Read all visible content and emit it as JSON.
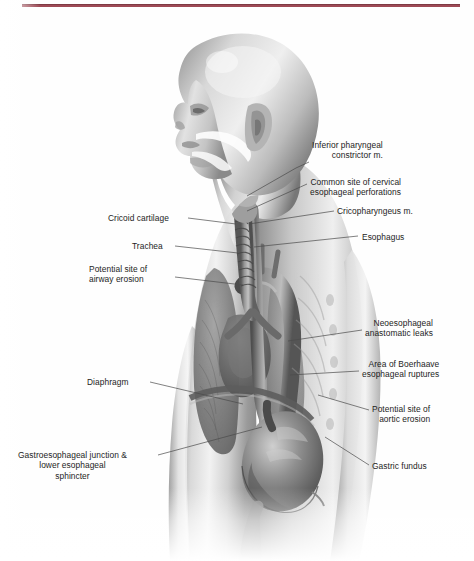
{
  "page": {
    "width": 474,
    "height": 561,
    "background_color": "#fefefe",
    "rule_color": "#9e4a55",
    "label_color": "#1d1d1d",
    "leader_color": "#4a4a4a"
  },
  "figure": {
    "name": "esophagus-anatomy-illustration",
    "palette": {
      "skin_light": "#e9e9e9",
      "skin_mid": "#b6b6b6",
      "skin_shadow": "#6f6f6f",
      "organ_dark": "#555555",
      "organ_mid": "#7d7d7d",
      "organ_light": "#c9c9c9",
      "highlight": "#ffffff"
    }
  },
  "labels": [
    {
      "id": "inferior-pharyngeal-constrictor",
      "text": "Inferior pharyngeal\nconstrictor m.",
      "side": "right",
      "align": "left",
      "x": 312,
      "y": 140,
      "leader": [
        [
          309,
          162
        ],
        [
          296,
          168
        ],
        [
          247,
          196
        ]
      ]
    },
    {
      "id": "common-site-cervical-perforations",
      "text": "Common site of cervical\nesophageal perforations",
      "side": "right",
      "align": "left",
      "x": 310,
      "y": 177,
      "leader": [
        [
          307,
          184
        ],
        [
          247,
          211
        ]
      ]
    },
    {
      "id": "cricopharyngeus-muscle",
      "text": "Cricopharyngeus m.",
      "side": "right",
      "align": "left",
      "x": 337,
      "y": 206,
      "leader": [
        [
          334,
          211
        ],
        [
          249,
          224
        ]
      ]
    },
    {
      "id": "esophagus",
      "text": "Esophagus",
      "side": "right",
      "align": "left",
      "x": 362,
      "y": 232,
      "leader": [
        [
          358,
          236
        ],
        [
          254,
          247
        ]
      ]
    },
    {
      "id": "neoesophageal-anastomotic-leaks",
      "text": "Neoesophageal\nanastomatic leaks",
      "side": "right",
      "align": "left",
      "x": 365,
      "y": 318,
      "leader": [
        [
          362,
          330
        ],
        [
          288,
          341
        ]
      ]
    },
    {
      "id": "area-of-boerhaave-ruptures",
      "text": "Area of Boerhaave\nesophageal ruptures",
      "side": "right",
      "align": "left",
      "x": 362,
      "y": 359,
      "leader": [
        [
          359,
          371
        ],
        [
          290,
          375
        ]
      ]
    },
    {
      "id": "potential-site-aortic-erosion",
      "text": "Potential site of\naortic erosion",
      "side": "right",
      "align": "left",
      "x": 372,
      "y": 404,
      "leader": [
        [
          369,
          410
        ],
        [
          318,
          395
        ]
      ]
    },
    {
      "id": "gastric-fundus",
      "text": "Gastric fundus",
      "side": "right",
      "align": "left",
      "x": 372,
      "y": 461,
      "leader": [
        [
          369,
          465
        ],
        [
          325,
          437
        ]
      ]
    },
    {
      "id": "cricoid-cartilage",
      "text": "Cricoid cartilage",
      "side": "left",
      "align": "right",
      "x": 108,
      "y": 213,
      "leader": [
        [
          188,
          218
        ],
        [
          236,
          224
        ]
      ]
    },
    {
      "id": "trachea",
      "text": "Trachea",
      "side": "left",
      "align": "right",
      "x": 132,
      "y": 241,
      "leader": [
        [
          175,
          246
        ],
        [
          238,
          253
        ]
      ]
    },
    {
      "id": "potential-site-airway-erosion",
      "text": "Potential site of\nairway erosion",
      "side": "left",
      "align": "right",
      "x": 89,
      "y": 264,
      "leader": [
        [
          175,
          277
        ],
        [
          243,
          285
        ]
      ]
    },
    {
      "id": "diaphragm",
      "text": "Diaphragm",
      "side": "left",
      "align": "right",
      "x": 87,
      "y": 377,
      "leader": [
        [
          150,
          382
        ],
        [
          243,
          404
        ]
      ]
    },
    {
      "id": "gastroesophageal-junction",
      "text": "Gastroesophageal junction &\nlower esophageal\nsphincter",
      "side": "left",
      "align": "center",
      "x": 18,
      "y": 450,
      "leader": [
        [
          158,
          455
        ],
        [
          262,
          427
        ]
      ]
    }
  ]
}
